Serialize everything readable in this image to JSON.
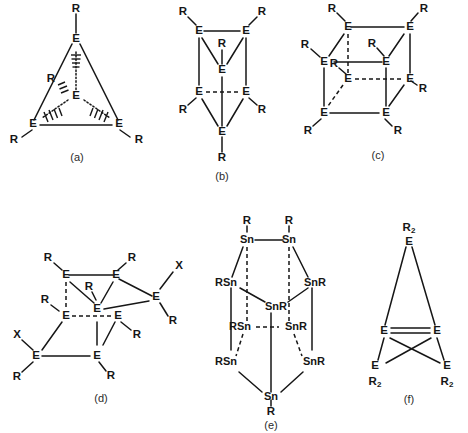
{
  "figure": {
    "background_color": "#ffffff",
    "line_color": "#161616",
    "panels": [
      {
        "id": "a",
        "label": "(a)",
        "shape": "tetrahedron",
        "vertex_element": "E",
        "substituent": "R",
        "vertex_count": 4,
        "atoms": [
          {
            "label": "E",
            "role": "apex-top"
          },
          {
            "label": "E",
            "role": "front-left"
          },
          {
            "label": "E",
            "role": "front-right"
          },
          {
            "label": "E",
            "role": "center-back"
          }
        ],
        "substituents": [
          "R",
          "R",
          "R",
          "R"
        ]
      },
      {
        "id": "b",
        "label": "(b)",
        "shape": "trigonal-prism",
        "vertex_element": "E",
        "substituent": "R",
        "vertex_count": 6,
        "atoms": [
          {
            "label": "E",
            "role": "top-left"
          },
          {
            "label": "E",
            "role": "top-right"
          },
          {
            "label": "E",
            "role": "top-back"
          },
          {
            "label": "E",
            "role": "bottom-left"
          },
          {
            "label": "E",
            "role": "bottom-right"
          },
          {
            "label": "E",
            "role": "bottom-back"
          }
        ],
        "substituents": [
          "R",
          "R",
          "R",
          "R",
          "R",
          "R"
        ]
      },
      {
        "id": "c",
        "label": "(c)",
        "shape": "cube",
        "vertex_element": "E",
        "substituent": "R",
        "vertex_count": 8,
        "atoms": [
          {
            "label": "E",
            "role": "back-top-left"
          },
          {
            "label": "E",
            "role": "back-top-right"
          },
          {
            "label": "E",
            "role": "front-top-left"
          },
          {
            "label": "E",
            "role": "front-top-right"
          },
          {
            "label": "E",
            "role": "back-bottom-left"
          },
          {
            "label": "E",
            "role": "back-bottom-right"
          },
          {
            "label": "E",
            "role": "front-bottom-left"
          },
          {
            "label": "E",
            "role": "front-bottom-right"
          }
        ],
        "substituents": [
          "R",
          "R",
          "R",
          "R",
          "R",
          "R",
          "R",
          "R"
        ]
      },
      {
        "id": "d",
        "label": "(d)",
        "shape": "cube-with-exocyclic-vertices",
        "vertex_element": "E",
        "substituent": "R",
        "halide_substituent": "X",
        "vertex_count": 8,
        "atoms": [
          {
            "label": "E",
            "role": "back-top-left"
          },
          {
            "label": "E",
            "role": "back-top-right"
          },
          {
            "label": "E",
            "role": "front-top-center"
          },
          {
            "label": "E",
            "role": "right-wing",
            "extra": "X"
          },
          {
            "label": "E",
            "role": "front-left"
          },
          {
            "label": "E",
            "role": "front-right"
          },
          {
            "label": "E",
            "role": "bottom-left",
            "extra": "X"
          },
          {
            "label": "E",
            "role": "bottom-center"
          }
        ],
        "substituents": [
          "R",
          "R",
          "R",
          "R",
          "R",
          "R",
          "R",
          "R"
        ],
        "halides": [
          "X",
          "X"
        ]
      },
      {
        "id": "e",
        "label": "(e)",
        "shape": "tin-decamer-prismane",
        "vertex_element": "Sn",
        "substituent": "R",
        "vertex_count": 10,
        "atoms": [
          {
            "label": "Sn",
            "sub_label": "R",
            "role": "top-left"
          },
          {
            "label": "Sn",
            "sub_label": "R",
            "role": "top-right"
          },
          {
            "label": "RSn",
            "role": "upper-left-outer"
          },
          {
            "label": "SnR",
            "role": "upper-right-outer"
          },
          {
            "label": "SnR",
            "role": "upper-center-back"
          },
          {
            "label": "RSn",
            "role": "mid-left-inner"
          },
          {
            "label": "SnR",
            "role": "mid-right-inner"
          },
          {
            "label": "RSn",
            "role": "lower-left-outer"
          },
          {
            "label": "SnR",
            "role": "lower-right-outer"
          },
          {
            "label": "Sn",
            "sub_label": "R",
            "role": "bottom-center"
          }
        ]
      },
      {
        "id": "f",
        "label": "(f)",
        "shape": "butterfly-crossed-ring",
        "vertex_element": "E",
        "substituent": "R2",
        "substituent_display": "R₂",
        "vertex_count": 5,
        "atoms": [
          {
            "label": "E",
            "sub_label": "R2",
            "role": "apex-top"
          },
          {
            "label": "E",
            "role": "mid-left"
          },
          {
            "label": "E",
            "role": "mid-right"
          },
          {
            "label": "E",
            "sub_label": "R2",
            "role": "bottom-left"
          },
          {
            "label": "E",
            "sub_label": "R2",
            "role": "bottom-right"
          }
        ]
      }
    ]
  },
  "labels": {
    "E": "E",
    "R": "R",
    "X": "X",
    "Sn": "Sn",
    "RSn": "RSn",
    "SnR": "SnR",
    "R_sub2": "R",
    "subscript_2": "2",
    "panel_a": "(a)",
    "panel_b": "(b)",
    "panel_c": "(c)",
    "panel_d": "(d)",
    "panel_e": "(e)",
    "panel_f": "(f)"
  }
}
